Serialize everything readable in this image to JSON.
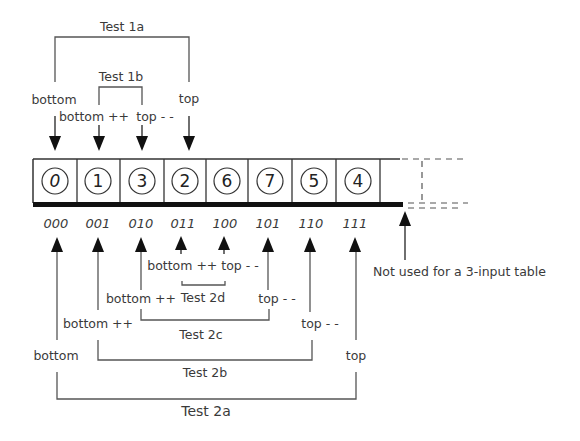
{
  "diagram": {
    "cells": [
      {
        "value": "0",
        "index": "000"
      },
      {
        "value": "1",
        "index": "001"
      },
      {
        "value": "3",
        "index": "010"
      },
      {
        "value": "2",
        "index": "011"
      },
      {
        "value": "6",
        "index": "100"
      },
      {
        "value": "7",
        "index": "101"
      },
      {
        "value": "5",
        "index": "110"
      },
      {
        "value": "4",
        "index": "111"
      }
    ],
    "unused_note": "Not used for a 3-input table",
    "top_tests": {
      "test_1a": {
        "label": "Test 1a",
        "left": "bottom",
        "right": "top"
      },
      "test_1b": {
        "label": "Test 1b",
        "left": "bottom ++",
        "right": "top - -"
      }
    },
    "bottom_tests": {
      "test_2a": {
        "label": "Test 2a",
        "left": "bottom",
        "right": "top"
      },
      "test_2b": {
        "label": "Test 2b",
        "left": "bottom ++",
        "right": "top - -"
      },
      "test_2c": {
        "label": "Test 2c",
        "left": "bottom ++",
        "right": "top - -"
      },
      "test_2d": {
        "label": "Test 2d",
        "left_right": "bottom ++ top - -"
      }
    }
  }
}
